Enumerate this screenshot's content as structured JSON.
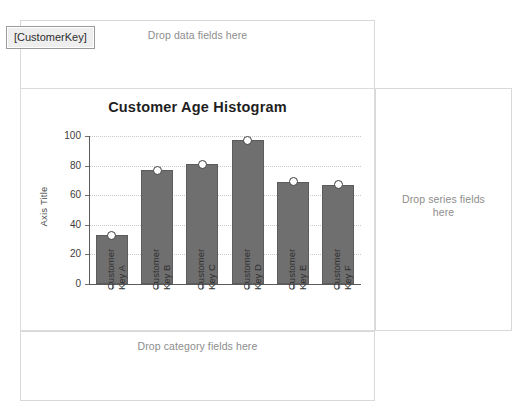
{
  "designer": {
    "data_zone": {
      "hint": "Drop data fields here",
      "field": "[Sum(Age)]"
    },
    "series_zone": {
      "hint": "Drop series fields\nhere"
    },
    "category_zone": {
      "hint": "Drop category fields here",
      "field": "[CustomerKey]"
    }
  },
  "colors": {
    "bar_fill": "#6f6f6f",
    "bar_border": "#5c5c5c",
    "marker_fill": "#ffffff",
    "marker_border": "#3d3d3d",
    "gridline": "#c9c9c9",
    "axis_line": "#5a5a5a",
    "hint_text": "#8d8d8d",
    "panel_border": "#dcdcdc"
  },
  "chart_data": {
    "type": "bar",
    "title": "Customer Age Histogram",
    "xlabel": "Age",
    "ylabel": "Axis Title",
    "categories": [
      "Customer\nKey A",
      "Customer\nKey B",
      "Customer\nKey C",
      "Customer\nKey D",
      "Customer\nKey E",
      "Customer\nKey F"
    ],
    "values": [
      33,
      77,
      81,
      97,
      69,
      67
    ],
    "series": [
      {
        "name": "Sum(Age)",
        "values": [
          33,
          77,
          81,
          97,
          69,
          67
        ]
      }
    ],
    "ylim": [
      0,
      100
    ],
    "yticks": [
      0,
      20,
      40,
      60,
      80,
      100
    ],
    "ytick_labels": [
      "0",
      "20",
      "40",
      "60",
      "80",
      "100"
    ],
    "grid": true,
    "legend": "none",
    "markers": "circle"
  }
}
